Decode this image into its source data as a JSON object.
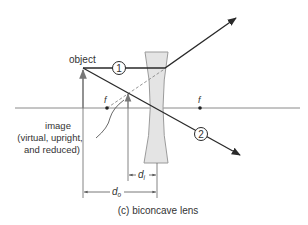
{
  "diagram": {
    "caption": "(c)  biconcave lens",
    "object_label": "object",
    "image_label_lines": [
      "image",
      "(virtual, upright,",
      "and reduced)"
    ],
    "focal_left_label": "f",
    "focal_right_label": "f",
    "ray1_label": "1",
    "ray2_label": "2",
    "di_label": "d",
    "di_sub": "i",
    "do_label": "d",
    "do_sub": "o"
  },
  "colors": {
    "ray": "#2a2a2a",
    "axis": "#888888",
    "lens_fill": "#e4e4e4",
    "lens_stroke": "#9a9a9a",
    "text": "#333333"
  }
}
